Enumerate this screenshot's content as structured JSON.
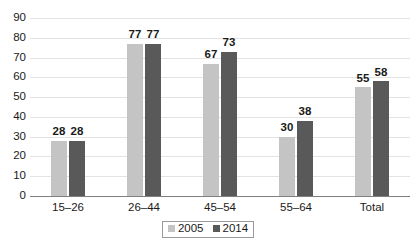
{
  "chart_data": {
    "type": "bar",
    "title": "",
    "subtitle": "",
    "xlabel": "",
    "ylabel": "",
    "ylim": [
      0,
      90
    ],
    "ytick_step": 10,
    "yticks": [
      90,
      80,
      70,
      60,
      50,
      40,
      30,
      20,
      10,
      0
    ],
    "grid": true,
    "legend_position": "bottom-center",
    "categories": [
      "15–26",
      "26–44",
      "45–54",
      "55–64",
      "Total"
    ],
    "series": [
      {
        "name": "2005",
        "color": "#c4c4c4",
        "values": [
          28,
          77,
          67,
          30,
          55
        ]
      },
      {
        "name": "2014",
        "color": "#595959",
        "values": [
          28,
          77,
          73,
          38,
          58
        ]
      }
    ],
    "data_labels": [
      [
        "28",
        "28"
      ],
      [
        "77",
        "77"
      ],
      [
        "67",
        "73"
      ],
      [
        "30",
        "38"
      ],
      [
        "55",
        "58"
      ]
    ]
  },
  "colors": {
    "series_2005": "#c4c4c4",
    "series_2014": "#595959",
    "gridline": "#e3e3e3",
    "axis": "#808080",
    "text": "#1a1a1a",
    "background": "#ffffff",
    "legend_border": "#9a9a9a"
  }
}
